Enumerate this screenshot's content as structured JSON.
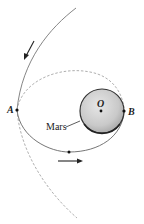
{
  "diagram": {
    "labels": {
      "point_a": "A",
      "point_b": "B",
      "center": "O",
      "planet": "Mars"
    },
    "elements": {
      "approach_trajectory": "solid hyperbolic path entering from top",
      "departure_trajectory": "dashed continuation below A",
      "upper_orbit_arc": "dashed arc from A to B",
      "lower_orbit_arc": "solid elliptical arc from A to B",
      "planet_body": "shaded sphere centered at O"
    },
    "arrows": [
      {
        "name": "approach-direction",
        "direction": "down-left"
      },
      {
        "name": "orbit-direction",
        "direction": "right"
      }
    ],
    "colors": {
      "line": "#555555",
      "dashed": "#888888",
      "planet_fill": "#c8c8c8",
      "planet_edge": "#333333",
      "text": "#222222"
    }
  }
}
